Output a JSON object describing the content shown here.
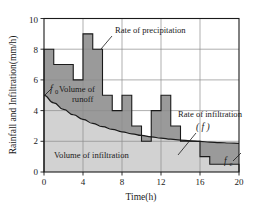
{
  "figure": {
    "background_color": "#ffffff",
    "plot_border_color": "#1a1a1a",
    "grid_color": "#8c8c8c",
    "precip_fill": "#9a9a9a",
    "infil_fill": "#d2d2d2",
    "curve_color": "#1a1a1a"
  },
  "axes": {
    "x_title": "Time(h)",
    "y_title": "Rainfall and Infiltration(mm/h)",
    "x_ticks": [
      "0",
      "4",
      "8",
      "12",
      "16",
      "20"
    ],
    "x_tick_values": [
      0,
      4,
      8,
      12,
      16,
      20
    ],
    "y_ticks": [
      "0",
      "2",
      "4",
      "6",
      "8",
      "10"
    ],
    "y_tick_values": [
      0,
      2,
      4,
      6,
      8,
      10
    ],
    "xlim": [
      0,
      20
    ],
    "ylim": [
      0,
      10
    ],
    "grid": "on"
  },
  "annotations": [
    {
      "id": "rate-of-precipitation",
      "text": "Rate of precipitation",
      "x": 115,
      "y": 33,
      "leader": {
        "x1": 112,
        "y1": 36,
        "x2": 101,
        "y2": 49
      }
    },
    {
      "id": "volume-of-runoff",
      "text_line1": "Volume of",
      "text_line2": "runoff",
      "x": 62,
      "y": 92,
      "x2": 72,
      "y2": 102,
      "symbol": "f",
      "symbol_sub": "0",
      "symbol_x": 52,
      "symbol_y": 92,
      "leader": {
        "x1": 51,
        "y1": 89,
        "x2": 44,
        "y2": 96
      }
    },
    {
      "id": "volume-of-infiltration",
      "text": "Volume of infiltration",
      "x": 54,
      "y": 158
    },
    {
      "id": "rate-of-infiltration",
      "text": "Rate of infiltration",
      "x": 178,
      "y": 117,
      "symbol": "( f )",
      "symbol_x": 197,
      "symbol_y": 130,
      "leader": {
        "x1": 196,
        "y1": 133,
        "x2": 178,
        "y2": 155
      }
    },
    {
      "id": "fc-label",
      "symbol": "f",
      "symbol_sub": "c",
      "symbol_x": 224,
      "symbol_y": 164,
      "leader": {
        "x1": 233,
        "y1": 161,
        "x2": 241,
        "y2": 153
      }
    }
  ],
  "chart_data": {
    "type": "bar",
    "title": "",
    "xlabel": "Time(h)",
    "ylabel": "Rainfall and Infiltration(mm/h)",
    "xlim": [
      0,
      20
    ],
    "ylim": [
      0,
      10
    ],
    "grid": "on",
    "legend": "none",
    "series": [
      {
        "name": "Rate of precipitation",
        "type": "step-histogram",
        "bin_edges": [
          0,
          1,
          2,
          3,
          4,
          5,
          6,
          7,
          8,
          9,
          10,
          11,
          12,
          13,
          14,
          15,
          16,
          17,
          20
        ],
        "values": [
          8,
          7,
          7,
          6,
          9,
          8,
          5,
          4,
          5,
          3,
          2,
          4,
          5,
          3,
          2,
          2,
          1,
          0.5
        ]
      },
      {
        "name": "Rate of infiltration (f)",
        "type": "curve",
        "description": "Horton exponential decay f = fc + (f0 - fc) * exp(-k t)",
        "f0": 5,
        "fc": 1.45,
        "k": 0.17,
        "points_x": [
          0,
          1,
          2,
          3,
          4,
          5,
          6,
          7,
          8,
          9,
          10,
          11,
          12,
          13,
          14,
          15,
          16,
          17,
          18,
          19,
          20
        ],
        "points_y": [
          5.0,
          4.5,
          4.08,
          3.73,
          3.43,
          3.17,
          2.96,
          2.78,
          2.62,
          2.49,
          2.38,
          2.29,
          2.21,
          2.14,
          2.08,
          2.03,
          1.99,
          1.95,
          1.92,
          1.89,
          1.87
        ]
      }
    ],
    "regions": [
      {
        "name": "Volume of runoff",
        "fill": "#9a9a9a",
        "description": "Area between precipitation histogram and infiltration curve"
      },
      {
        "name": "Volume of infiltration",
        "fill": "#d2d2d2",
        "description": "Area under the infiltration curve"
      }
    ]
  }
}
